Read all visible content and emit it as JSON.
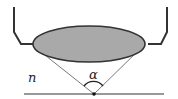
{
  "diagram": {
    "labels": {
      "medium": "n",
      "angle": "α"
    },
    "colors": {
      "lens_fill": "#a9a9a9",
      "lens_stroke": "#333333",
      "housing": "#333333",
      "cone": "#555555",
      "baseline": "#777777",
      "focal_point": "#111111"
    }
  }
}
